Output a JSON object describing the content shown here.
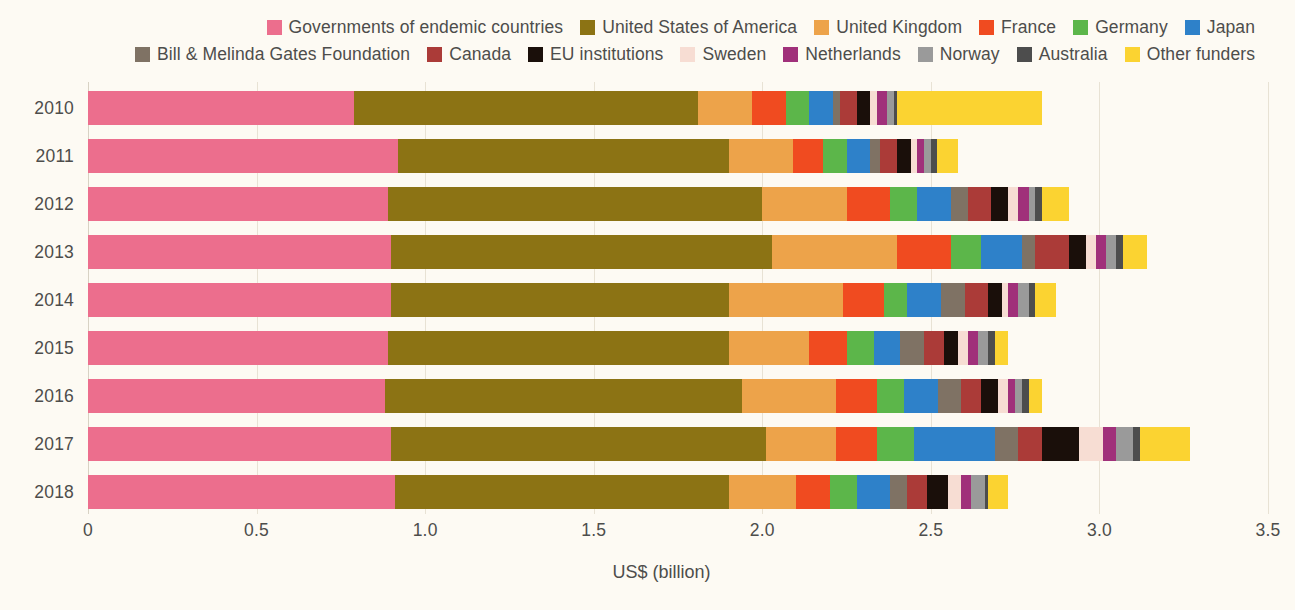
{
  "chart_data": {
    "type": "bar",
    "orientation": "horizontal",
    "stacked": true,
    "title": "",
    "subtitle": "",
    "xlabel": "US$ (billion)",
    "ylabel": "",
    "xlim": [
      0,
      3.5
    ],
    "xticks": [
      0,
      0.5,
      1.0,
      1.5,
      2.0,
      2.5,
      3.0,
      3.5
    ],
    "xtick_labels": [
      "0",
      "0.5",
      "1.0",
      "1.5",
      "2.0",
      "2.5",
      "3.0",
      "3.5"
    ],
    "grid": true,
    "legend_position": "top",
    "categories": [
      "2010",
      "2011",
      "2012",
      "2013",
      "2014",
      "2015",
      "2016",
      "2017",
      "2018"
    ],
    "series": [
      {
        "name": "Governments of endemic countries",
        "color": "#ec6e8d",
        "values": [
          0.79,
          0.92,
          0.89,
          0.9,
          0.9,
          0.89,
          0.88,
          0.9,
          0.91
        ]
      },
      {
        "name": "United States of America",
        "color": "#8c7314",
        "values": [
          1.02,
          0.98,
          1.11,
          1.13,
          1.0,
          1.01,
          1.06,
          1.11,
          0.99
        ]
      },
      {
        "name": "United Kingdom",
        "color": "#eda34a",
        "values": [
          0.16,
          0.19,
          0.25,
          0.37,
          0.34,
          0.24,
          0.28,
          0.21,
          0.2
        ]
      },
      {
        "name": "France",
        "color": "#f04b20",
        "values": [
          0.1,
          0.09,
          0.13,
          0.16,
          0.12,
          0.11,
          0.12,
          0.12,
          0.1
        ]
      },
      {
        "name": "Germany",
        "color": "#5cb64a",
        "values": [
          0.07,
          0.07,
          0.08,
          0.09,
          0.07,
          0.08,
          0.08,
          0.11,
          0.08
        ]
      },
      {
        "name": "Japan",
        "color": "#2e81c9",
        "values": [
          0.07,
          0.07,
          0.1,
          0.12,
          0.1,
          0.08,
          0.1,
          0.24,
          0.1
        ]
      },
      {
        "name": "Bill & Melinda Gates Foundation",
        "color": "#7f7264",
        "values": [
          0.02,
          0.03,
          0.05,
          0.04,
          0.07,
          0.07,
          0.07,
          0.07,
          0.05
        ]
      },
      {
        "name": "Canada",
        "color": "#ab3b38",
        "values": [
          0.05,
          0.05,
          0.07,
          0.1,
          0.07,
          0.06,
          0.06,
          0.07,
          0.06
        ]
      },
      {
        "name": "EU institutions",
        "color": "#1a0f0a",
        "values": [
          0.04,
          0.04,
          0.05,
          0.05,
          0.04,
          0.04,
          0.05,
          0.11,
          0.06
        ]
      },
      {
        "name": "Sweden",
        "color": "#f7ddd3",
        "values": [
          0.02,
          0.02,
          0.03,
          0.03,
          0.02,
          0.03,
          0.03,
          0.07,
          0.04
        ]
      },
      {
        "name": "Netherlands",
        "color": "#a0307a",
        "values": [
          0.03,
          0.02,
          0.03,
          0.03,
          0.03,
          0.03,
          0.02,
          0.04,
          0.03
        ]
      },
      {
        "name": "Norway",
        "color": "#9a9a9a",
        "values": [
          0.02,
          0.02,
          0.02,
          0.03,
          0.03,
          0.03,
          0.02,
          0.05,
          0.04
        ]
      },
      {
        "name": "Australia",
        "color": "#4d4d4d",
        "values": [
          0.01,
          0.02,
          0.02,
          0.02,
          0.02,
          0.02,
          0.02,
          0.02,
          0.01
        ]
      },
      {
        "name": "Other funders",
        "color": "#fbd331",
        "values": [
          0.43,
          0.06,
          0.08,
          0.07,
          0.06,
          0.04,
          0.04,
          0.15,
          0.06
        ]
      }
    ],
    "totals": [
      2.83,
      2.57,
      2.91,
      3.14,
      2.82,
      2.73,
      2.86,
      3.18,
      2.74
    ]
  },
  "legend": {
    "rows": [
      [
        {
          "label": "Governments of endemic countries",
          "color": "#ec6e8d",
          "icon": "legend-swatch"
        },
        {
          "label": "United States of America",
          "color": "#8c7314",
          "icon": "legend-swatch"
        },
        {
          "label": "United Kingdom",
          "color": "#eda34a",
          "icon": "legend-swatch"
        },
        {
          "label": "France",
          "color": "#f04b20",
          "icon": "legend-swatch"
        },
        {
          "label": "Germany",
          "color": "#5cb64a",
          "icon": "legend-swatch"
        },
        {
          "label": "Japan",
          "color": "#2e81c9",
          "icon": "legend-swatch"
        }
      ],
      [
        {
          "label": "Bill & Melinda Gates Foundation",
          "color": "#7f7264",
          "icon": "legend-swatch"
        },
        {
          "label": "Canada",
          "color": "#ab3b38",
          "icon": "legend-swatch"
        },
        {
          "label": "EU institutions",
          "color": "#1a0f0a",
          "icon": "legend-swatch"
        },
        {
          "label": "Sweden",
          "color": "#f7ddd3",
          "icon": "legend-swatch"
        },
        {
          "label": "Netherlands",
          "color": "#a0307a",
          "icon": "legend-swatch"
        },
        {
          "label": "Norway",
          "color": "#9a9a9a",
          "icon": "legend-swatch"
        },
        {
          "label": "Australia",
          "color": "#4d4d4d",
          "icon": "legend-swatch"
        },
        {
          "label": "Other funders",
          "color": "#fbd331",
          "icon": "legend-swatch"
        }
      ]
    ]
  }
}
